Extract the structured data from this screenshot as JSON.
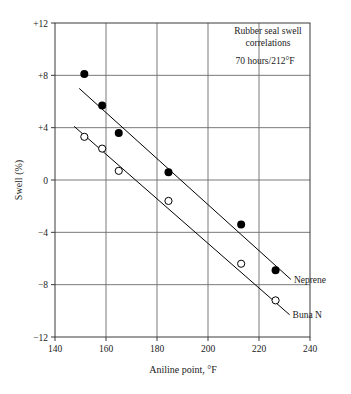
{
  "chart_data": {
    "type": "scatter",
    "title": "",
    "xlabel": "Aniline point, °F",
    "ylabel": "Swell (%)",
    "xlim": [
      140,
      240
    ],
    "ylim": [
      -12,
      12
    ],
    "xticks": [
      "140",
      "160",
      "180",
      "200",
      "220",
      "240"
    ],
    "yticks": [
      "+12",
      "+8",
      "+4",
      "0",
      "−4",
      "−8",
      "−12"
    ],
    "xtick_values": [
      140,
      160,
      180,
      200,
      220,
      240
    ],
    "ytick_values": [
      12,
      8,
      4,
      0,
      -4,
      -8,
      -12
    ],
    "grid": true,
    "legend": "inline-right",
    "annotations": [
      "Rubber seal swell",
      "correlations",
      "70 hours/212°F"
    ],
    "series": [
      {
        "name": "Neprene",
        "marker": "filled-circle",
        "color": "#000000",
        "points": [
          {
            "x": 151.5,
            "y": 8.1
          },
          {
            "x": 158.5,
            "y": 5.7
          },
          {
            "x": 165.0,
            "y": 3.6
          },
          {
            "x": 184.5,
            "y": 0.6
          },
          {
            "x": 213.0,
            "y": -3.4
          },
          {
            "x": 226.5,
            "y": -6.9
          }
        ],
        "trendline": {
          "x1": 149.5,
          "y1": 7.0,
          "x2": 232.5,
          "y2": -7.6
        }
      },
      {
        "name": "Buna N",
        "marker": "open-circle",
        "color": "#000000",
        "points": [
          {
            "x": 151.5,
            "y": 3.3
          },
          {
            "x": 158.5,
            "y": 2.4
          },
          {
            "x": 165.0,
            "y": 0.7
          },
          {
            "x": 184.5,
            "y": -1.6
          },
          {
            "x": 213.0,
            "y": -6.4
          },
          {
            "x": 226.5,
            "y": -9.2
          }
        ],
        "trendline": {
          "x1": 147.5,
          "y1": 4.1,
          "x2": 232.0,
          "y2": -10.3
        }
      }
    ]
  },
  "figure": {
    "axis_color": "#3a3a3a",
    "grid_color": "#6b6b6b",
    "background": "#ffffff"
  }
}
